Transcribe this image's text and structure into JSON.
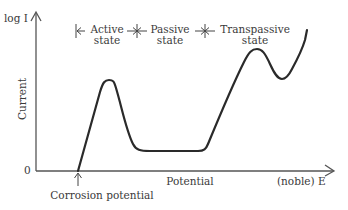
{
  "diagram": {
    "y_axis": {
      "label_top": "log I",
      "label_side": "Current",
      "origin": "0"
    },
    "x_axis": {
      "label_mid": "Potential",
      "label_end": "(noble) E"
    },
    "annotations": {
      "corrosion_potential": "Corrosion potential",
      "regions": [
        {
          "line1": "Active",
          "line2": "state"
        },
        {
          "line1": "Passive",
          "line2": "state"
        },
        {
          "line1": "Transpassive",
          "line2": "state"
        }
      ]
    },
    "colors": {
      "curve": "#2a2a2a",
      "axis": "#555555",
      "text": "#3a3a3a"
    }
  }
}
